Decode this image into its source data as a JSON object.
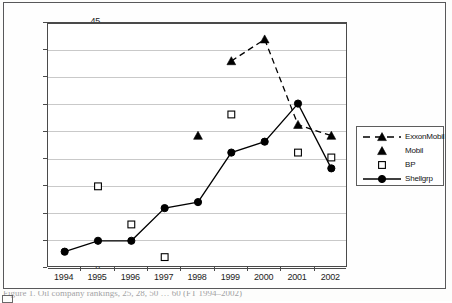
{
  "figure": {
    "ylabel": "Ranking (lower is better)",
    "caption": "Figure 1. Oil company rankings, 25, 28, 50 … 60 (FT 1994–2002)"
  },
  "axis": {
    "y_ticks": [
      "0",
      "5",
      "10",
      "15",
      "20",
      "25",
      "30",
      "35",
      "40",
      "45"
    ],
    "x_ticks": [
      "1994",
      "1995",
      "1996",
      "1997",
      "1998",
      "1999",
      "2000",
      "2001",
      "2002"
    ]
  },
  "legend": {
    "items": [
      {
        "label": "ExxonMobil",
        "glyph": "dashed-line-triangle",
        "color": "#000000"
      },
      {
        "label": "Mobil",
        "glyph": "triangle",
        "color": "#000000"
      },
      {
        "label": "BP",
        "glyph": "open-square",
        "color": "#000000"
      },
      {
        "label": "Shellgrp",
        "glyph": "solid-line-circle",
        "color": "#000000"
      }
    ]
  },
  "chart_data": {
    "type": "line",
    "title": "",
    "xlabel": "",
    "ylabel": "Ranking (lower is better)",
    "categories": [
      "1994",
      "1995",
      "1996",
      "1997",
      "1998",
      "1999",
      "2000",
      "2001",
      "2002"
    ],
    "ylim": [
      0,
      45
    ],
    "ytick_step": 5,
    "grid": "horizontal",
    "legend_position": "right",
    "series": [
      {
        "name": "ExxonMobil",
        "marker": "filled-triangle",
        "line": "dashed",
        "color": "#000000",
        "values": [
          null,
          null,
          null,
          null,
          null,
          38,
          42,
          26.3,
          24.3
        ]
      },
      {
        "name": "Mobil",
        "marker": "filled-triangle",
        "line": "none",
        "color": "#000000",
        "values": [
          null,
          null,
          null,
          null,
          24.3,
          null,
          null,
          null,
          null
        ]
      },
      {
        "name": "BP",
        "marker": "open-square",
        "line": "none",
        "color": "#000000",
        "values": [
          null,
          15,
          8,
          2,
          null,
          28.2,
          null,
          21.2,
          20.3
        ]
      },
      {
        "name": "Shellgrp",
        "marker": "filled-circle",
        "line": "solid",
        "color": "#000000",
        "values": [
          3,
          5,
          5,
          11,
          12.1,
          21.2,
          23.2,
          30.2,
          18.3
        ]
      }
    ]
  }
}
